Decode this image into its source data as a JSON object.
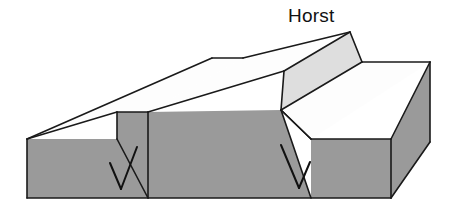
{
  "figure": {
    "title": "Horst",
    "type": "block-diagram",
    "background_color": "#ffffff"
  },
  "labels": [
    {
      "id": "horst-label",
      "text": "Horst",
      "x": 288,
      "y": 6,
      "font_size": 19,
      "color": "#111111"
    }
  ],
  "colors": {
    "outline": "#1a1a1a",
    "top_surface": "#fdfdfd",
    "front_face": "#9a9a9a",
    "fault_scarp_face": "#9a9a9a",
    "horst_flank": "#dedede",
    "side_face": "#9a9a9a",
    "arrow": "#111111",
    "background": "#ffffff"
  },
  "geometry": {
    "stroke_width": 1.6,
    "faces": [
      {
        "name": "left-top-surface",
        "fill_key": "top_surface",
        "points": "27,139 212,58 243,58 148,112 117,112"
      },
      {
        "name": "horst-top-surface",
        "fill_key": "top_surface",
        "points": "148,112 243,58 350,32 284,71"
      },
      {
        "name": "horst-right-flank",
        "fill_key": "horst_flank",
        "points": "350,32 362,62 281,110 284,71"
      },
      {
        "name": "right-top-surface",
        "fill_key": "top_surface",
        "points": "281,110 362,62 430,62 311,139"
      },
      {
        "name": "left-front-face",
        "fill_key": "front_face",
        "points": "27,139 117,139 148,198 27,198"
      },
      {
        "name": "left-fault-scarp",
        "fill_key": "fault_scarp_face",
        "points": "117,112 148,112 148,198 117,139"
      },
      {
        "name": "graben-front-face",
        "fill_key": "front_face",
        "points": "148,112 281,110 311,198 148,198"
      },
      {
        "name": "right-front-face",
        "fill_key": "front_face",
        "points": "311,139 391,139 391,198 311,198"
      },
      {
        "name": "right-side-face",
        "fill_key": "side_face",
        "points": "391,139 430,62 430,142 391,198"
      }
    ],
    "edges": [
      {
        "name": "left-top-back-edge",
        "path": "M27,139 L212,58"
      },
      {
        "name": "back-notch-edge",
        "path": "M212,58 L243,58"
      },
      {
        "name": "horst-back-rise-edge",
        "path": "M243,58 L350,32"
      },
      {
        "name": "horst-crest-right-edge",
        "path": "M350,32 L362,62"
      },
      {
        "name": "right-back-edge",
        "path": "M362,62 L430,62"
      },
      {
        "name": "left-top-front-edge",
        "path": "M27,139 L117,112"
      },
      {
        "name": "left-scarp-crest",
        "path": "M117,112 L148,112"
      },
      {
        "name": "horst-left-flank-crest",
        "path": "M148,112 L284,71"
      },
      {
        "name": "horst-crest-front-edge",
        "path": "M284,71 L350,32"
      },
      {
        "name": "horst-flank-base",
        "path": "M284,71 L281,110"
      },
      {
        "name": "horst-right-flank-base",
        "path": "M281,110 L362,62"
      },
      {
        "name": "right-top-front-edge",
        "path": "M281,110 L311,139"
      },
      {
        "name": "right-top-outer-edge",
        "path": "M311,139 L391,139"
      },
      {
        "name": "right-corner-edge",
        "path": "M391,139 L430,62"
      },
      {
        "name": "left-vertical-edge",
        "path": "M27,139 L27,198"
      },
      {
        "name": "left-fault-plane-edge",
        "path": "M117,139 L148,198"
      },
      {
        "name": "right-fault-plane-edge",
        "path": "M311,139 L281,110"
      },
      {
        "name": "right-vertical-edge",
        "path": "M391,139 L391,198"
      },
      {
        "name": "bottom-front-edge",
        "path": "M27,198 L391,198"
      },
      {
        "name": "right-bottom-bevel",
        "path": "M391,198 L430,142"
      },
      {
        "name": "right-far-vertical-edge",
        "path": "M430,62 L430,142"
      },
      {
        "name": "left-scarp-inner-edge",
        "path": "M117,112 L117,139"
      },
      {
        "name": "graben-left-wall-edge",
        "path": "M148,112 L148,198"
      },
      {
        "name": "graben-right-wall-edge",
        "path": "M281,110 L311,198"
      }
    ],
    "arrows": [
      {
        "name": "left-fault-slip-arrow",
        "shaft": "M137,147 L121,189",
        "barb": "M110,163 L121,189",
        "direction": "down-left",
        "meaning": "hanging-wall downthrow"
      },
      {
        "name": "right-fault-slip-arrow",
        "shaft": "M281,145 L299,188",
        "barb": "M310,162 L299,188",
        "direction": "down-right",
        "meaning": "hanging-wall downthrow"
      }
    ]
  }
}
